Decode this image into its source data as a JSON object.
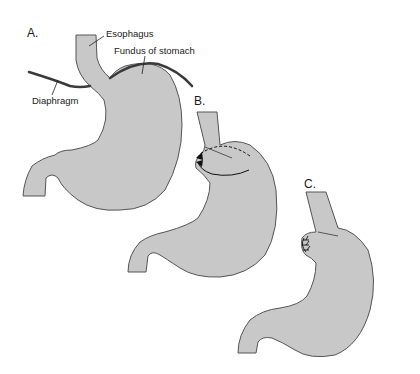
{
  "figure": {
    "colors": {
      "stomach_fill": "#c8c8c8",
      "outline": "#555555",
      "diaphragm": "#3a3a3a",
      "text": "#1a1a1a"
    }
  },
  "panels": [
    {
      "letter": "A.",
      "labels": {
        "esophagus": "Esophagus",
        "fundus": "Fundus of stomach",
        "diaphragm": "Diaphragm"
      }
    },
    {
      "letter": "B."
    },
    {
      "letter": "C."
    }
  ]
}
